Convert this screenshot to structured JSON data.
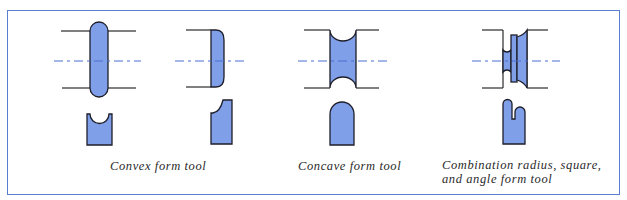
{
  "figure": {
    "border_color": "#5b7fcf",
    "fill_color": "#7f9fe8",
    "panels": [
      {
        "id": "convex",
        "caption": "Convex form tool"
      },
      {
        "id": "concave",
        "caption": "Concave form tool"
      },
      {
        "id": "combination",
        "caption_line1": "Combination radius, square,",
        "caption_line2": "and angle form tool"
      }
    ]
  }
}
